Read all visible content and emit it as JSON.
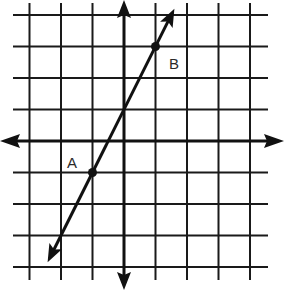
{
  "figure": {
    "type": "coordinate-plane-line",
    "grid": {
      "x_min": -3,
      "x_max": 4,
      "y_min": -4,
      "y_max": 4,
      "unit_px": 31.5,
      "origin_px": [
        124,
        141
      ],
      "grid_color": "#1a1a1a",
      "axis_color": "#111111"
    },
    "axes": {
      "x_axis": {
        "arrows": "both",
        "y_px": 141
      },
      "y_axis": {
        "arrows": "both",
        "x_px": 124
      }
    },
    "line": {
      "slope": 2,
      "y_intercept": 1,
      "arrows": "both",
      "color": "#111111"
    },
    "points": [
      {
        "label": "A",
        "x": -1,
        "y": -1
      },
      {
        "label": "B",
        "x": 1,
        "y": 3
      }
    ]
  },
  "chart_data": {
    "type": "line",
    "title": "",
    "xlabel": "",
    "ylabel": "",
    "x": [
      -1,
      1
    ],
    "y": [
      -1,
      3
    ],
    "points": [
      {
        "label": "A",
        "x": -1,
        "y": -1
      },
      {
        "label": "B",
        "x": 1,
        "y": 3
      }
    ],
    "equation": "y = 2x + 1",
    "xlim": [
      -3,
      4
    ],
    "ylim": [
      -4,
      4
    ],
    "grid": true,
    "legend": null
  }
}
